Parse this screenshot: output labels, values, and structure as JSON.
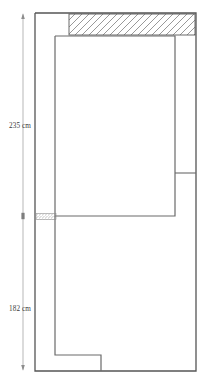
{
  "drawing": {
    "type": "architectural-floor-plan",
    "title": "",
    "units": "cm",
    "stroke_color": "#555555",
    "hatch_color": "#6d6d6d",
    "dimension_color": "#888888",
    "label_color": "#3a3a3a",
    "background": "#ffffff"
  },
  "dimensions": [
    {
      "id": "upper",
      "label": "235 cm",
      "value": 235,
      "unit": "cm",
      "orientation": "vertical",
      "from_y": 13,
      "to_y": 216
    },
    {
      "id": "lower",
      "label": "182 cm",
      "value": 182,
      "unit": "cm",
      "orientation": "vertical",
      "from_y": 216,
      "to_y": 371
    }
  ],
  "geometry": {
    "outer_wall": {
      "name": "outer-boundary",
      "points": "35,13 196,13 196,371 35,371 35,13"
    },
    "inner_room": {
      "name": "inner-room",
      "points": "55,36 175,36 175,216 55,216 55,36"
    },
    "lower_partition": {
      "name": "lower-partition-wall",
      "points": "55,216 55,355 101,355 101,371"
    },
    "corridor_divider": {
      "name": "corridor-divider",
      "points": "175,173 196,173"
    },
    "hatched_band": {
      "name": "hatched-wall-band",
      "x": 69,
      "y": 14,
      "width": 126,
      "height": 21,
      "pattern": "diagonal-hatch"
    },
    "door_opening": {
      "name": "door-opening",
      "x": 36,
      "y": 213.5,
      "width": 20,
      "height": 6,
      "pattern": "fine-hatch"
    }
  },
  "annotations": {
    "icon_names": [
      "dimension-arrow-icon",
      "dimension-tick-icon",
      "hatch-pattern-icon"
    ]
  }
}
